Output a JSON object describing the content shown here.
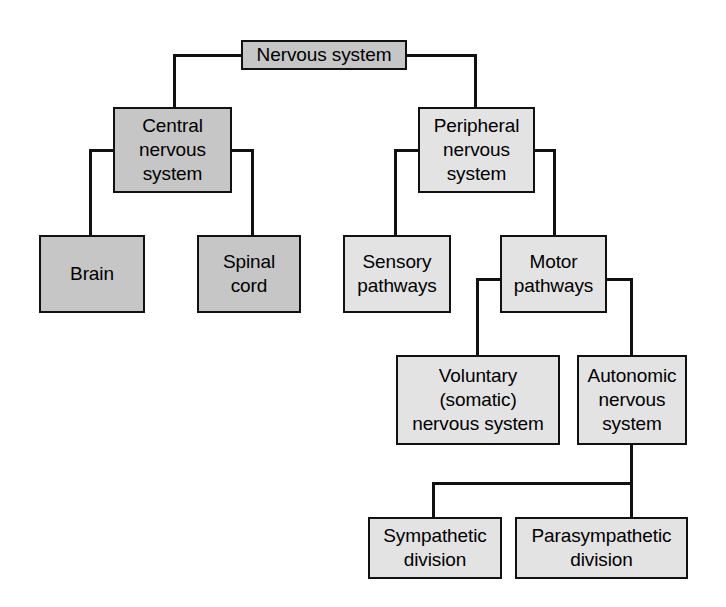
{
  "diagram": {
    "type": "hierarchy-tree",
    "colors": {
      "fill_dark": "#c6c6c6",
      "fill_light": "#e3e3e3",
      "stroke": "#111111",
      "text": "#000000",
      "background": "#ffffff"
    },
    "nodes": {
      "nervous_system": {
        "label": "Nervous system",
        "lines": [
          "Nervous system"
        ]
      },
      "central_nervous": {
        "label": "Central nervous system",
        "lines": [
          "Central",
          "nervous",
          "system"
        ]
      },
      "brain": {
        "label": "Brain",
        "lines": [
          "Brain"
        ]
      },
      "spinal_cord": {
        "label": "Spinal cord",
        "lines": [
          "Spinal",
          "cord"
        ]
      },
      "peripheral_nervous": {
        "label": "Peripheral nervous system",
        "lines": [
          "Peripheral",
          "nervous",
          "system"
        ]
      },
      "sensory_pathways": {
        "label": "Sensory pathways",
        "lines": [
          "Sensory",
          "pathways"
        ]
      },
      "motor_pathways": {
        "label": "Motor pathways",
        "lines": [
          "Motor",
          "pathways"
        ]
      },
      "voluntary_somatic": {
        "label": "Voluntary (somatic) nervous system",
        "lines": [
          "Voluntary",
          "(somatic)",
          "nervous system"
        ]
      },
      "autonomic_nervous": {
        "label": "Autonomic nervous system",
        "lines": [
          "Autonomic",
          "nervous",
          "system"
        ]
      },
      "sympathetic_division": {
        "label": "Sympathetic division",
        "lines": [
          "Sympathetic",
          "division"
        ]
      },
      "parasympathetic_division": {
        "label": "Parasympathetic division",
        "lines": [
          "Parasympathetic",
          "division"
        ]
      }
    },
    "edges": [
      {
        "from": "nervous_system",
        "to": "central_nervous"
      },
      {
        "from": "nervous_system",
        "to": "peripheral_nervous"
      },
      {
        "from": "central_nervous",
        "to": "brain"
      },
      {
        "from": "central_nervous",
        "to": "spinal_cord"
      },
      {
        "from": "peripheral_nervous",
        "to": "sensory_pathways"
      },
      {
        "from": "peripheral_nervous",
        "to": "motor_pathways"
      },
      {
        "from": "motor_pathways",
        "to": "voluntary_somatic"
      },
      {
        "from": "motor_pathways",
        "to": "autonomic_nervous"
      },
      {
        "from": "autonomic_nervous",
        "to": "sympathetic_division"
      },
      {
        "from": "autonomic_nervous",
        "to": "parasympathetic_division"
      }
    ]
  }
}
